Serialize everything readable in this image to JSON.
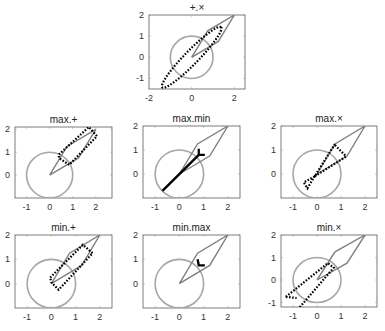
{
  "colors": {
    "circle": "#a6a6a6",
    "kite": "#808080",
    "result": "#000000",
    "axis": "#444444"
  },
  "chart_data": [
    {
      "type": "line",
      "title": "+.×",
      "xlim": [
        -2,
        2.5
      ],
      "ylim": [
        -1.5,
        2
      ],
      "xticks": [
        -2,
        0,
        2
      ],
      "yticks": [
        -1,
        0,
        1,
        2
      ],
      "box": {
        "x": 149,
        "y": 15,
        "w": 96,
        "h": 74
      },
      "result": "ellipse_dotted",
      "desc": "tilted ellipse through (-1.3,-1.4) to (1.4,1.5)"
    },
    {
      "type": "line",
      "title": "max.+",
      "xlim": [
        -1.5,
        2.7
      ],
      "ylim": [
        -1,
        2.1
      ],
      "xticks": [
        -1,
        0,
        1,
        2
      ],
      "yticks": [
        0,
        1,
        2
      ],
      "box": {
        "x": 15,
        "y": 127,
        "w": 97,
        "h": 71
      },
      "result": "rounded_rect",
      "desc": "band from (0.4,0.8) to (2.0,2.1)"
    },
    {
      "type": "line",
      "title": "max.min",
      "xlim": [
        -1.5,
        2.5
      ],
      "ylim": [
        -1,
        2
      ],
      "xticks": [
        -1,
        0,
        1,
        2
      ],
      "yticks": [
        0,
        1,
        2
      ],
      "box": {
        "x": 143,
        "y": 126,
        "w": 97,
        "h": 72
      },
      "result": "y_shape",
      "desc": "thick line (-0.7,-0.7)-(0.7,0.7) with fork to (0.8,1.0),(1.0,0.8)"
    },
    {
      "type": "line",
      "title": "max.×",
      "xlim": [
        -1.5,
        2.5
      ],
      "ylim": [
        -1,
        2
      ],
      "xticks": [
        -1,
        0,
        1,
        2
      ],
      "yticks": [
        0,
        1,
        2
      ],
      "box": {
        "x": 281,
        "y": 126,
        "w": 96,
        "h": 72
      },
      "result": "bowtie_dotted",
      "desc": "dotted bowtie inside kite, small box near (-0.5,-0.5)"
    },
    {
      "type": "line",
      "title": "min.+",
      "xlim": [
        -1.5,
        2.5
      ],
      "ylim": [
        -1,
        2
      ],
      "xticks": [
        -1,
        0,
        1,
        2
      ],
      "yticks": [
        0,
        1,
        2
      ],
      "box": {
        "x": 15,
        "y": 235,
        "w": 97,
        "h": 73
      },
      "result": "rounded_rect_low",
      "desc": "band from (0,0.2) to (1.7,1.6)"
    },
    {
      "type": "line",
      "title": "min.max",
      "xlim": [
        -1.5,
        2.5
      ],
      "ylim": [
        -1,
        2
      ],
      "xticks": [
        -1,
        0,
        1,
        2
      ],
      "yticks": [
        0,
        1,
        2
      ],
      "box": {
        "x": 143,
        "y": 235,
        "w": 97,
        "h": 73
      },
      "result": "L_shape",
      "desc": "small L at (0.8,1.0)-(0.8,0.8)-(1.0,0.8)"
    },
    {
      "type": "line",
      "title": "min.×",
      "xlim": [
        -1.5,
        2.5
      ],
      "ylim": [
        -1.2,
        2
      ],
      "xticks": [
        -1,
        0,
        1,
        2
      ],
      "yticks": [
        -1,
        0,
        1,
        2
      ],
      "box": {
        "x": 281,
        "y": 235,
        "w": 96,
        "h": 72
      },
      "result": "bowtie_large",
      "desc": "dotted bowtie from (-1.3,-1.2) to (0.8,0.8)"
    }
  ],
  "common": {
    "circle": {
      "cx": 0,
      "cy": 0,
      "r": 1,
      "label": "unit circle"
    },
    "kite": [
      [
        0,
        0
      ],
      [
        0.75,
        1.25
      ],
      [
        2,
        2
      ],
      [
        1.25,
        0.75
      ],
      [
        0,
        0
      ]
    ]
  }
}
